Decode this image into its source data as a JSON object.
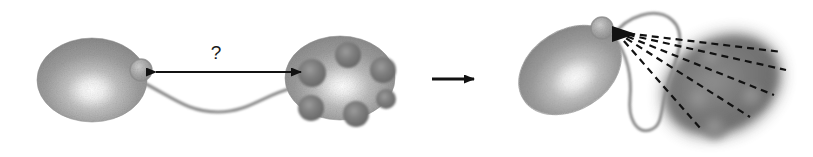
{
  "figure": {
    "background_color": "#ffffff",
    "width": 813,
    "height": 157
  },
  "palette": {
    "body_fill_light": "#9a9a9a",
    "body_fill_mid": "#8a8a8a",
    "body_highlight": "#ffffff",
    "bump_fill": "#707070",
    "bump_edge": "#5e5e5e",
    "dark_body_fill": "#6e6e6e",
    "dark_body_blur_halo": "#8d8d8d",
    "line_stroke": "#707070",
    "arrow_stroke": "#111111",
    "dashed_stroke": "#111111",
    "text_color": "#1a1a1a"
  },
  "panel_left": {
    "name": "separated-state-panel",
    "question_label": "?",
    "measure_arrow": {
      "name": "distance-double-arrow",
      "style": "double-headed",
      "label": "?",
      "x_start": 145,
      "x_end": 312,
      "y": 72
    },
    "organelle_a": {
      "name": "light-organelle-left",
      "shape": "ellipse",
      "cx": 92,
      "cy": 80,
      "rx": 55,
      "ry": 42,
      "rotation_deg": 0,
      "bump_count": 1,
      "bumps": [
        {
          "cx": 141,
          "cy": 70,
          "r": 11
        }
      ]
    },
    "organelle_b": {
      "name": "bumpy-organelle-right",
      "shape": "ellipse",
      "cx": 340,
      "cy": 78,
      "rx": 55,
      "ry": 42,
      "rotation_deg": 0,
      "bump_count": 6,
      "bumps": [
        {
          "cx": 312,
          "cy": 73,
          "r": 14
        },
        {
          "cx": 348,
          "cy": 55,
          "r": 13
        },
        {
          "cx": 383,
          "cy": 70,
          "r": 13
        },
        {
          "cx": 311,
          "cy": 108,
          "r": 13
        },
        {
          "cx": 356,
          "cy": 114,
          "r": 13
        },
        {
          "cx": 386,
          "cy": 99,
          "r": 10
        }
      ]
    },
    "connector": {
      "name": "wavy-tether",
      "description": "S-shaped tube connecting the two organelles",
      "from_x": 146,
      "to_x": 292,
      "y": 88
    }
  },
  "transition": {
    "name": "transition-arrow",
    "glyph": "arrow-right",
    "x_start": 432,
    "x_end": 482,
    "y": 79
  },
  "panel_right": {
    "name": "contacted-state-panel",
    "organelle_a": {
      "name": "light-organelle-tilted",
      "shape": "ellipse",
      "cx": 570,
      "cy": 70,
      "rx": 55,
      "ry": 40,
      "rotation_deg": -32,
      "bump_count": 1,
      "bumps": [
        {
          "cx": 602,
          "cy": 28,
          "r": 11
        }
      ]
    },
    "organelle_b": {
      "name": "dark-blurred-organelle",
      "shape": "ellipse",
      "cx": 722,
      "cy": 85,
      "rx": 62,
      "ry": 48,
      "rotation_deg": -28,
      "blurred": true,
      "bump_count": 4,
      "bumps": [
        {
          "cx": 712,
          "cy": 58,
          "r": 12
        },
        {
          "cx": 700,
          "cy": 100,
          "r": 12
        },
        {
          "cx": 752,
          "cy": 97,
          "r": 11
        },
        {
          "cx": 715,
          "cy": 128,
          "r": 11
        }
      ]
    },
    "connector": {
      "name": "looping-tether",
      "description": "Curved loop from the bump arcing right and down"
    },
    "contact_lines": {
      "name": "dashed-contact-lines",
      "style": "dashed",
      "count": 5,
      "origin_x": 616,
      "origin_y": 32,
      "endpoints": [
        {
          "x": 782,
          "y": 52
        },
        {
          "x": 786,
          "y": 70
        },
        {
          "x": 774,
          "y": 95
        },
        {
          "x": 750,
          "y": 117
        },
        {
          "x": 700,
          "y": 128
        }
      ]
    }
  }
}
